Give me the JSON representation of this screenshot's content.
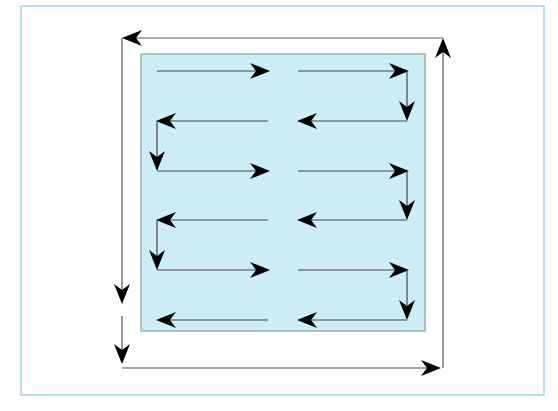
{
  "diagram": {
    "title": "",
    "colors": {
      "page_background": "#ffffff",
      "frame_border": "#9fd6e3",
      "inner_fill": "#cdeef7",
      "inner_border": "#8a9a9e",
      "perimeter_line": "#555555",
      "arrow_line": "#444444",
      "arrowhead": "#000000"
    },
    "frame": {
      "x": 21,
      "y": 6,
      "width": 523,
      "height": 389
    },
    "inner_region": {
      "x": 141,
      "y": 54,
      "width": 284,
      "height": 277
    },
    "perimeter_path": {
      "left_x": 122,
      "right_x": 443,
      "top_y": 38,
      "bottom_y": 368,
      "segments": [
        {
          "name": "top-leftward",
          "from": [
            443,
            38
          ],
          "to": [
            122,
            38
          ],
          "arrow_at": "end"
        },
        {
          "name": "left-down-1",
          "from": [
            122,
            38
          ],
          "to": [
            122,
            302
          ],
          "arrow_at": "end"
        },
        {
          "name": "left-down-2",
          "from": [
            122,
            316
          ],
          "to": [
            122,
            362
          ],
          "arrow_at": "end"
        },
        {
          "name": "bottom-rightward",
          "from": [
            122,
            368
          ],
          "to": [
            440,
            368
          ],
          "arrow_at": "end"
        },
        {
          "name": "right-upward",
          "from": [
            443,
            368
          ],
          "to": [
            443,
            40
          ],
          "arrow_at": "end"
        }
      ]
    },
    "scan_rows": {
      "y_values": [
        71,
        121,
        171,
        220,
        270,
        320
      ],
      "left_half": {
        "x_start": 157,
        "x_end": 268
      },
      "right_half": {
        "x_start": 298,
        "x_end": 407
      },
      "rows": [
        {
          "index": 1,
          "direction": "right",
          "turn_down_side": "right"
        },
        {
          "index": 2,
          "direction": "left",
          "turn_down_side": "left"
        },
        {
          "index": 3,
          "direction": "right",
          "turn_down_side": "right"
        },
        {
          "index": 4,
          "direction": "left",
          "turn_down_side": "left"
        },
        {
          "index": 5,
          "direction": "right",
          "turn_down_side": "right"
        },
        {
          "index": 6,
          "direction": "left",
          "turn_down_side": "none"
        }
      ]
    }
  }
}
